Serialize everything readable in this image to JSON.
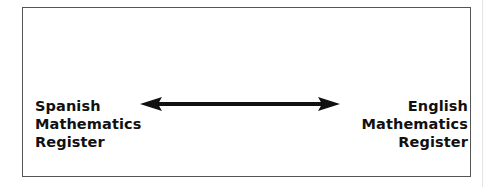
{
  "diagram": {
    "left_label": {
      "lines": [
        "Spanish",
        "Mathematics",
        "Register"
      ]
    },
    "right_label": {
      "lines": [
        "English",
        "Mathematics",
        "Register"
      ]
    },
    "connector": {
      "type": "double-headed-arrow",
      "color": "#111111"
    },
    "border_color": "#555555"
  }
}
